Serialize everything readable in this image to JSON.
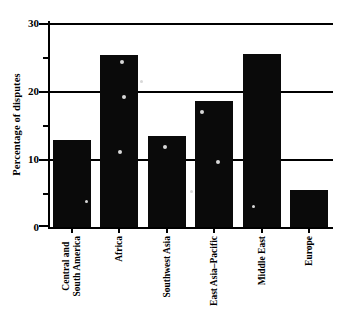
{
  "chart_data": {
    "type": "bar",
    "title": "",
    "xlabel": "",
    "ylabel": "Percentage of disputes",
    "categories": [
      "Central and South America",
      "Africa",
      "Southwest Asia",
      "East Asia–Pacific",
      "Middle East",
      "Europe"
    ],
    "category_lines": [
      [
        "Central and",
        "South America"
      ],
      [
        "Africa"
      ],
      [
        "Southwest Asia"
      ],
      [
        "East Asia–Pacific"
      ],
      [
        "Middle East"
      ],
      [
        "Europe"
      ]
    ],
    "values": [
      12.8,
      25.3,
      13.4,
      18.6,
      25.5,
      5.5
    ],
    "ylim": [
      0,
      30
    ],
    "ymajor_ticks": [
      0,
      10,
      20,
      30
    ],
    "yminor_ticks": [
      5,
      15,
      25
    ],
    "ytick_labels": [
      "0",
      "10",
      "20",
      "30"
    ],
    "grid": "horizontal-major",
    "legend": "none",
    "bar_color": "#0a0a0a",
    "axis_color": "#000000",
    "background_color": "#ffffff"
  },
  "axis": {
    "y_title": "Percentage of disputes",
    "y_labels": {
      "t30": "30",
      "t20": "20",
      "t10": "10",
      "t0": "0"
    }
  },
  "categories": {
    "c0_line1": "Central and",
    "c0_line2": "South America",
    "c1_line1": "Africa",
    "c2_line1": "Southwest Asia",
    "c3_line1": "East Asia–Pacific",
    "c4_line1": "Middle East",
    "c5_line1": "Europe"
  }
}
